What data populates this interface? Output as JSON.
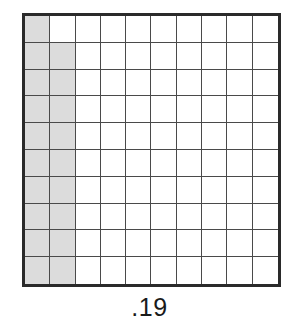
{
  "figure": {
    "caption": ".19",
    "grid": {
      "rows": 10,
      "columns": 10,
      "total_cells": 100,
      "shaded_count": 19,
      "shaded_color": "#dcdcdc",
      "unshaded_color": "#ffffff",
      "border_color": "#2a2a2a",
      "gridline_color": "#4a4a4a",
      "background_color": "#ffffff",
      "shaded_map": [
        [
          1,
          0,
          0,
          0,
          0,
          0,
          0,
          0,
          0,
          0
        ],
        [
          1,
          1,
          0,
          0,
          0,
          0,
          0,
          0,
          0,
          0
        ],
        [
          1,
          1,
          0,
          0,
          0,
          0,
          0,
          0,
          0,
          0
        ],
        [
          1,
          1,
          0,
          0,
          0,
          0,
          0,
          0,
          0,
          0
        ],
        [
          1,
          1,
          0,
          0,
          0,
          0,
          0,
          0,
          0,
          0
        ],
        [
          1,
          1,
          0,
          0,
          0,
          0,
          0,
          0,
          0,
          0
        ],
        [
          1,
          1,
          0,
          0,
          0,
          0,
          0,
          0,
          0,
          0
        ],
        [
          1,
          1,
          0,
          0,
          0,
          0,
          0,
          0,
          0,
          0
        ],
        [
          1,
          1,
          0,
          0,
          0,
          0,
          0,
          0,
          0,
          0
        ],
        [
          1,
          1,
          0,
          0,
          0,
          0,
          0,
          0,
          0,
          0
        ]
      ]
    }
  },
  "chart_data": {
    "type": "heatmap",
    "title": ".19",
    "xlabel": "",
    "ylabel": "",
    "rows": 10,
    "columns": 10,
    "categories": [
      "c1",
      "c2",
      "c3",
      "c4",
      "c5",
      "c6",
      "c7",
      "c8",
      "c9",
      "c10"
    ],
    "values": [
      [
        1,
        0,
        0,
        0,
        0,
        0,
        0,
        0,
        0,
        0
      ],
      [
        1,
        1,
        0,
        0,
        0,
        0,
        0,
        0,
        0,
        0
      ],
      [
        1,
        1,
        0,
        0,
        0,
        0,
        0,
        0,
        0,
        0
      ],
      [
        1,
        1,
        0,
        0,
        0,
        0,
        0,
        0,
        0,
        0
      ],
      [
        1,
        1,
        0,
        0,
        0,
        0,
        0,
        0,
        0,
        0
      ],
      [
        1,
        1,
        0,
        0,
        0,
        0,
        0,
        0,
        0,
        0
      ],
      [
        1,
        1,
        0,
        0,
        0,
        0,
        0,
        0,
        0,
        0
      ],
      [
        1,
        1,
        0,
        0,
        0,
        0,
        0,
        0,
        0,
        0
      ],
      [
        1,
        1,
        0,
        0,
        0,
        0,
        0,
        0,
        0,
        0
      ],
      [
        1,
        1,
        0,
        0,
        0,
        0,
        0,
        0,
        0,
        0
      ]
    ],
    "shaded_count": 19,
    "total_cells": 100,
    "fraction_shaded": 0.19,
    "grid": true,
    "legend": false
  }
}
